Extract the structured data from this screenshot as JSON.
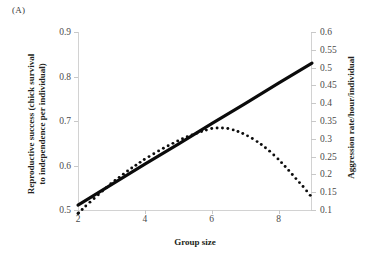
{
  "panel": {
    "label": "(A)"
  },
  "axes": {
    "x": {
      "title": "Group size",
      "ticks": [
        "2",
        "4",
        "6",
        "8"
      ],
      "tick_values": [
        2,
        4,
        6,
        8
      ],
      "min": 2,
      "max": 9
    },
    "y_left": {
      "title_line1": "Reproductive success (chick survival",
      "title_line2": "to independence per individual)",
      "ticks": [
        "0.5",
        "0.6",
        "0.7",
        "0.8",
        "0.9"
      ],
      "tick_values": [
        0.5,
        0.6,
        0.7,
        0.8,
        0.9
      ],
      "min": 0.5,
      "max": 0.9
    },
    "y_right": {
      "title": "Aggression rate/hour/individual",
      "ticks": [
        "0.1",
        "0.15",
        "0.2",
        "0.25",
        "0.3",
        "0.35",
        "0.4",
        "0.45",
        "0.5",
        "0.55",
        "0.6"
      ],
      "tick_values": [
        0.1,
        0.15,
        0.2,
        0.25,
        0.3,
        0.35,
        0.4,
        0.45,
        0.5,
        0.55,
        0.6
      ],
      "min": 0.1,
      "max": 0.6
    }
  },
  "colors": {
    "series_solid": "#0b0b0b",
    "series_dotted": "#0c0c0c",
    "axis": "#d2d2d2",
    "tick_label": "#4a4a4a",
    "text": "#231f20",
    "background": "#ffffff"
  },
  "chart_data": {
    "type": "line",
    "title": "",
    "xlabel": "Group size",
    "ylabel": "Reproductive success (chick survival to independence per individual)",
    "ylabel_secondary": "Aggression rate/hour/individual",
    "xlim": [
      2,
      9
    ],
    "ylim": [
      0.5,
      0.9
    ],
    "ylim_secondary": [
      0.1,
      0.6
    ],
    "grid": false,
    "legend": "none",
    "series": [
      {
        "name": "Reproductive success (chick survival to independence per individual)",
        "axis": "left",
        "style": "solid",
        "x": [
          2,
          3,
          4,
          5,
          6,
          7,
          8,
          9
        ],
        "values": [
          0.511,
          0.557,
          0.603,
          0.648,
          0.694,
          0.739,
          0.785,
          0.83
        ]
      },
      {
        "name": "Aggression rate/hour/individual",
        "axis": "right",
        "style": "dotted",
        "x": [
          2,
          2.25,
          2.5,
          2.75,
          3,
          3.25,
          3.5,
          3.75,
          4,
          4.25,
          4.5,
          4.75,
          5,
          5.25,
          5.5,
          5.75,
          6,
          6.25,
          6.5,
          6.75,
          7,
          7.25,
          7.5,
          7.75,
          8,
          8.25,
          8.5,
          8.75,
          9
        ],
        "values": [
          0.09,
          0.113,
          0.134,
          0.155,
          0.175,
          0.193,
          0.211,
          0.227,
          0.243,
          0.257,
          0.271,
          0.283,
          0.295,
          0.305,
          0.314,
          0.322,
          0.329,
          0.331,
          0.329,
          0.322,
          0.312,
          0.299,
          0.283,
          0.264,
          0.242,
          0.217,
          0.19,
          0.164,
          0.135
        ]
      }
    ]
  }
}
